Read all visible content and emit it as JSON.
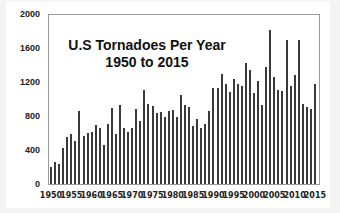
{
  "chart_data": {
    "type": "bar",
    "title": "U.S Tornadoes Per Year",
    "subtitle": "1950 to 2015",
    "xlabel": "",
    "ylabel": "",
    "ylim": [
      0,
      2000
    ],
    "yticks": [
      0,
      400,
      800,
      1200,
      1600,
      2000
    ],
    "xticks": [
      1950,
      1955,
      1960,
      1965,
      1970,
      1975,
      1980,
      1985,
      1990,
      1995,
      2000,
      2005,
      2010,
      2015
    ],
    "grid": false,
    "legend": "none",
    "color": "#3a3a3a",
    "categories": [
      1950,
      1951,
      1952,
      1953,
      1954,
      1955,
      1956,
      1957,
      1958,
      1959,
      1960,
      1961,
      1962,
      1963,
      1964,
      1965,
      1966,
      1967,
      1968,
      1969,
      1970,
      1971,
      1972,
      1973,
      1974,
      1975,
      1976,
      1977,
      1978,
      1979,
      1980,
      1981,
      1982,
      1983,
      1984,
      1985,
      1986,
      1987,
      1988,
      1989,
      1990,
      1991,
      1992,
      1993,
      1994,
      1995,
      1996,
      1997,
      1998,
      1999,
      2000,
      2001,
      2002,
      2003,
      2004,
      2005,
      2006,
      2007,
      2008,
      2009,
      2010,
      2011,
      2012,
      2013,
      2014,
      2015
    ],
    "values": [
      201,
      260,
      240,
      421,
      550,
      593,
      504,
      858,
      564,
      604,
      616,
      697,
      657,
      463,
      704,
      897,
      585,
      926,
      660,
      608,
      653,
      888,
      741,
      1102,
      947,
      920,
      835,
      852,
      788,
      855,
      866,
      783,
      1046,
      931,
      907,
      684,
      765,
      656,
      702,
      856,
      1133,
      1132,
      1297,
      1173,
      1082,
      1234,
      1173,
      1148,
      1424,
      1345,
      1075,
      1215,
      934,
      1374,
      1817,
      1264,
      1103,
      1096,
      1692,
      1156,
      1282,
      1691,
      939,
      907,
      886,
      1177
    ]
  },
  "axis": {
    "y_labels": [
      "2000",
      "1600",
      "1200",
      "800",
      "400",
      "0"
    ],
    "x_labels": [
      "1950",
      "1955",
      "1960",
      "1965",
      "1970",
      "1975",
      "1980",
      "1985",
      "1990",
      "1995",
      "2000",
      "2005",
      "2010",
      "2015"
    ]
  },
  "title": {
    "line1": "U.S Tornadoes Per Year",
    "line2": "1950 to 2015"
  }
}
